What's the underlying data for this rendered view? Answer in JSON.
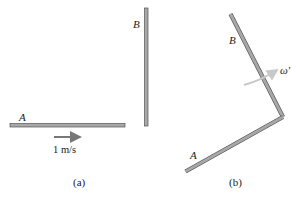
{
  "figure": {
    "panel_a": {
      "caption": "(a)",
      "rod_a_label": "A",
      "rod_b_label": "B",
      "velocity_label": "1 m/s"
    },
    "panel_b": {
      "caption": "(b)",
      "rod_a_label": "A",
      "rod_b_label": "B",
      "angular_velocity_label": "ω′"
    },
    "colors": {
      "rod_fill": "#a8a8a8",
      "rod_edge": "#555555",
      "arrow": "#777777",
      "omega_arrow": "#c8c8c8",
      "text": "#222222"
    }
  }
}
